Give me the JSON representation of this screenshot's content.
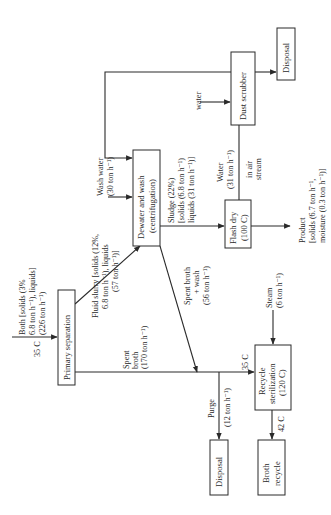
{
  "diagram": {
    "orientation": "rotated 90 degrees counter-clockwise",
    "nodes": {
      "primary_separation": {
        "label": "Primary separation"
      },
      "dewater_wash": {
        "lines": [
          "Dewater and wash",
          "(centrifugation)"
        ]
      },
      "flash_dry": {
        "lines": [
          "Flash dry",
          "(100 C)"
        ]
      },
      "dust_scrubber": {
        "label": "Dust scrubber"
      },
      "disposal_top": {
        "label": "Disposal"
      },
      "recycle_sterilization": {
        "lines": [
          "Recycle",
          "sterilization",
          "(120 C)"
        ]
      },
      "disposal_bottom": {
        "label": "Disposal"
      },
      "broth_recycle": {
        "lines": [
          "Broth",
          "recycle"
        ]
      }
    },
    "streams": {
      "feed": {
        "temp": "35 C",
        "lines": [
          "Both [solids (3%",
          "6.8 ton h⁻¹), liquids]",
          "(226 ton h⁻¹)"
        ]
      },
      "fluid_slurry": {
        "lines": [
          "Fluid slurry [solids (12%,",
          "6.8 ton h⁻¹), liquids",
          "(57 ton h⁻¹)]"
        ]
      },
      "wash_water": {
        "lines": [
          "Wash water",
          "(30 ton h⁻¹)"
        ]
      },
      "sludge": {
        "lines": [
          "Sludge (22%)",
          "[solids (6.8 ton h⁻¹)",
          "liquids (31 ton h⁻¹)]"
        ]
      },
      "spent_broth_wash": {
        "lines": [
          "Spent broth",
          "+ wash",
          "(56 ton h⁻¹)"
        ]
      },
      "spent_broth": {
        "lines": [
          "Spent",
          "broth",
          "(170 ton h⁻¹)"
        ]
      },
      "water_air": {
        "lines": [
          "Water",
          "(31 ton h⁻¹)",
          "in air",
          "stream"
        ]
      },
      "scrubber_water": {
        "label": "water"
      },
      "product": {
        "lines": [
          "Product",
          "[solids (6.7 ton h⁻¹,",
          "moisture (0.3 ton h⁻¹)]"
        ]
      },
      "steam": {
        "lines": [
          "Steam",
          "(6 ton h⁻¹)"
        ]
      },
      "recycle_in_temp": {
        "label": "35 C"
      },
      "purge": {
        "lines": [
          "Purge",
          "(12 ton h⁻¹)"
        ]
      },
      "recycle_out_temp": {
        "label": "42 C"
      }
    }
  }
}
